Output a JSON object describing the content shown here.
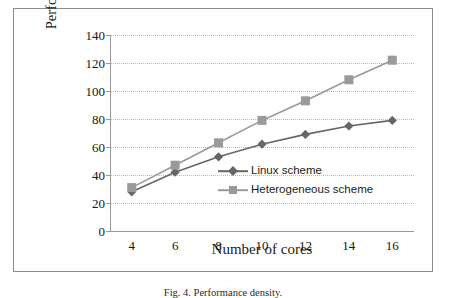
{
  "figure": {
    "caption": "Fig. 4.  Performance density."
  },
  "chart_data": {
    "type": "line",
    "title": "",
    "xlabel": "Number of cores",
    "ylabel": "Performance density (MBps/GB)",
    "x": [
      4,
      6,
      8,
      10,
      12,
      14,
      16
    ],
    "xtick_labels": [
      "4",
      "6",
      "8",
      "10",
      "12",
      "14",
      "16"
    ],
    "ytick_labels": [
      "0",
      "20",
      "40",
      "60",
      "80",
      "100",
      "120",
      "140"
    ],
    "yticks": [
      0,
      20,
      40,
      60,
      80,
      100,
      120,
      140
    ],
    "xlim": [
      3,
      17
    ],
    "ylim": [
      0,
      140
    ],
    "grid": "horizontal-dotted",
    "legend_position": "inside-lower-right",
    "series": [
      {
        "name": "Linux scheme",
        "values": [
          28,
          42,
          53,
          62,
          69,
          75,
          79
        ],
        "color": "#666666",
        "marker": "diamond"
      },
      {
        "name": "Heterogeneous scheme",
        "values": [
          31,
          47,
          63,
          79,
          93,
          108,
          122
        ],
        "color": "#9a9a9a",
        "marker": "square"
      }
    ]
  },
  "colors": {
    "frame": "#8d8d8d",
    "axis": "#9a9a9a",
    "gridline": "#b9b9b9",
    "background": "#ffffff"
  }
}
